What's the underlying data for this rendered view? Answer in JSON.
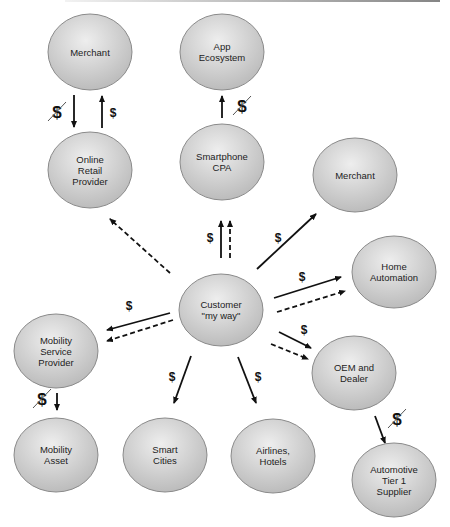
{
  "diagram": {
    "colors": {
      "node_fill_light": "#eeeeee",
      "node_fill_dark": "#b8b8b8",
      "node_stroke": "#8a8a8a",
      "arrow": "#111111",
      "text": "#222222"
    },
    "nodes": [
      {
        "id": "merchant-top",
        "lines": [
          "Merchant"
        ],
        "cx": 90,
        "cy": 52,
        "rx": 42,
        "ry": 38
      },
      {
        "id": "app-ecosystem",
        "lines": [
          "App",
          "Ecosystem"
        ],
        "cx": 222,
        "cy": 52,
        "rx": 42,
        "ry": 38
      },
      {
        "id": "online-retail-provider",
        "lines": [
          "Online",
          "Retail",
          "Provider"
        ],
        "cx": 90,
        "cy": 170,
        "rx": 42,
        "ry": 38
      },
      {
        "id": "smartphone-cpa",
        "lines": [
          "Smartphone",
          "CPA"
        ],
        "cx": 222,
        "cy": 162,
        "rx": 42,
        "ry": 38
      },
      {
        "id": "merchant-right",
        "lines": [
          "Merchant"
        ],
        "cx": 355,
        "cy": 175,
        "rx": 42,
        "ry": 37
      },
      {
        "id": "home-automation",
        "lines": [
          "Home",
          "Automation"
        ],
        "cx": 394,
        "cy": 272,
        "rx": 42,
        "ry": 36
      },
      {
        "id": "customer",
        "lines": [
          "Customer",
          "\"my way\""
        ],
        "cx": 221,
        "cy": 310,
        "rx": 42,
        "ry": 36
      },
      {
        "id": "mobility-service-provider",
        "lines": [
          "Mobility",
          "Service",
          "Provider"
        ],
        "cx": 56,
        "cy": 351,
        "rx": 42,
        "ry": 37
      },
      {
        "id": "oem-and-dealer",
        "lines": [
          "OEM and",
          "Dealer"
        ],
        "cx": 354,
        "cy": 373,
        "rx": 42,
        "ry": 37
      },
      {
        "id": "mobility-asset",
        "lines": [
          "Mobility",
          "Asset"
        ],
        "cx": 56,
        "cy": 455,
        "rx": 42,
        "ry": 37
      },
      {
        "id": "smart-cities",
        "lines": [
          "Smart",
          "Cities"
        ],
        "cx": 165,
        "cy": 455,
        "rx": 42,
        "ry": 37
      },
      {
        "id": "airlines-hotels",
        "lines": [
          "Airlines,",
          "Hotels"
        ],
        "cx": 273,
        "cy": 456,
        "rx": 42,
        "ry": 37
      },
      {
        "id": "automotive-tier-1-supplier",
        "lines": [
          "Automotive",
          "Tier 1",
          "Supplier"
        ],
        "cx": 394,
        "cy": 480,
        "rx": 42,
        "ry": 37
      }
    ],
    "edges": [
      {
        "id": "merchant-to-online-retail",
        "x1": 74,
        "y1": 95,
        "x2": 74,
        "y2": 127,
        "style": "solid"
      },
      {
        "id": "online-retail-to-merchant",
        "x1": 102,
        "y1": 128,
        "x2": 102,
        "y2": 96,
        "style": "solid"
      },
      {
        "id": "smartphone-to-app-ecosystem",
        "x1": 222,
        "y1": 118,
        "x2": 222,
        "y2": 96,
        "style": "solid"
      },
      {
        "id": "customer-to-online-retail",
        "x1": 170,
        "y1": 273,
        "x2": 110,
        "y2": 219,
        "style": "dashed"
      },
      {
        "id": "customer-to-smartphone-solid",
        "x1": 221,
        "y1": 258,
        "x2": 221,
        "y2": 221,
        "style": "solid"
      },
      {
        "id": "customer-to-smartphone-dashed",
        "x1": 230,
        "y1": 258,
        "x2": 230,
        "y2": 221,
        "style": "dashed"
      },
      {
        "id": "customer-to-merchant-right",
        "x1": 257,
        "y1": 269,
        "x2": 316,
        "y2": 214,
        "style": "solid"
      },
      {
        "id": "customer-to-home-automation-solid",
        "x1": 274,
        "y1": 298,
        "x2": 341,
        "y2": 277,
        "style": "solid"
      },
      {
        "id": "customer-to-home-automation-dashed",
        "x1": 277,
        "y1": 312,
        "x2": 345,
        "y2": 291,
        "style": "dashed"
      },
      {
        "id": "customer-to-mobility-service-solid",
        "x1": 170,
        "y1": 313,
        "x2": 107,
        "y2": 330,
        "style": "solid"
      },
      {
        "id": "customer-to-mobility-service-dashed",
        "x1": 173,
        "y1": 320,
        "x2": 107,
        "y2": 341,
        "style": "dashed"
      },
      {
        "id": "customer-to-oem-solid",
        "x1": 279,
        "y1": 332,
        "x2": 311,
        "y2": 348,
        "style": "solid"
      },
      {
        "id": "customer-to-oem-dashed",
        "x1": 271,
        "y1": 344,
        "x2": 308,
        "y2": 359,
        "style": "dashed"
      },
      {
        "id": "customer-to-smart-cities",
        "x1": 191,
        "y1": 356,
        "x2": 174,
        "y2": 403,
        "style": "solid"
      },
      {
        "id": "customer-to-airlines-hotels",
        "x1": 238,
        "y1": 357,
        "x2": 256,
        "y2": 403,
        "style": "solid"
      },
      {
        "id": "mobility-service-to-asset",
        "x1": 57,
        "y1": 393,
        "x2": 57,
        "y2": 410,
        "style": "solid"
      },
      {
        "id": "oem-to-tier1-supplier",
        "x1": 375,
        "y1": 416,
        "x2": 385,
        "y2": 443,
        "style": "solid"
      }
    ],
    "money_labels": [
      {
        "id": "merchant-to-online-retail-money",
        "text": "$",
        "x": 57,
        "y": 118,
        "crossed": true
      },
      {
        "id": "online-retail-to-merchant-money",
        "text": "$",
        "x": 113,
        "y": 117,
        "crossed": false
      },
      {
        "id": "smartphone-to-app-ecosystem-money",
        "text": "$",
        "x": 242,
        "y": 112,
        "crossed": true
      },
      {
        "id": "customer-to-smartphone-money",
        "text": "$",
        "x": 210,
        "y": 242,
        "crossed": false
      },
      {
        "id": "customer-to-merchant-right-money",
        "text": "$",
        "x": 278,
        "y": 242,
        "crossed": false
      },
      {
        "id": "customer-to-home-automation-money",
        "text": "$",
        "x": 302,
        "y": 281,
        "crossed": false
      },
      {
        "id": "customer-to-mobility-service-money",
        "text": "$",
        "x": 129,
        "y": 310,
        "crossed": false
      },
      {
        "id": "customer-to-oem-money",
        "text": "$",
        "x": 304,
        "y": 334,
        "crossed": false
      },
      {
        "id": "customer-to-smart-cities-money",
        "text": "$",
        "x": 172,
        "y": 381,
        "crossed": false
      },
      {
        "id": "customer-to-airlines-hotels-money",
        "text": "$",
        "x": 258,
        "y": 381,
        "crossed": false
      },
      {
        "id": "mobility-service-to-asset-money",
        "text": "$",
        "x": 42,
        "y": 405,
        "crossed": true
      },
      {
        "id": "oem-to-tier1-money",
        "text": "$",
        "x": 397,
        "y": 425,
        "crossed": true
      }
    ]
  }
}
